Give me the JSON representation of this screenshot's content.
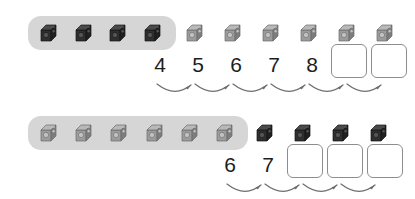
{
  "page": {
    "type": "counting-on-worksheet",
    "background_color": "#ffffff",
    "group_bar_color": "#d6d6d6",
    "dark_cube_color": "#3b3b3b",
    "light_cube_color": "#9a9a9a",
    "box_border_color": "#8d8d8d",
    "numeral_color": "#1d1d1d",
    "arrow_color": "#6e6e6e"
  },
  "rows": [
    {
      "id": "row-top",
      "group": {
        "label": "grouped-cubes",
        "count": 4,
        "shade": "dark",
        "x": 28,
        "y": 16,
        "width": 148,
        "height": 34
      },
      "loose_cubes": {
        "label": "loose-cubes",
        "count": 6,
        "shade": "light",
        "start_x": 186,
        "spacing": 38,
        "y": 16
      },
      "numerals": [
        {
          "value": "4",
          "x": 149,
          "y": 52
        },
        {
          "value": "5",
          "x": 187,
          "y": 52
        },
        {
          "value": "6",
          "x": 225,
          "y": 52
        },
        {
          "value": "7",
          "x": 263,
          "y": 52
        },
        {
          "value": "8",
          "x": 301,
          "y": 52
        }
      ],
      "answer_boxes": [
        {
          "label": "answer-box-1",
          "value": "",
          "x": 331,
          "y": 44,
          "width": 36,
          "height": 34
        },
        {
          "label": "answer-box-2",
          "value": "",
          "x": 371,
          "y": 44,
          "width": 36,
          "height": 34
        }
      ],
      "arrows": {
        "count": 6,
        "start_x": 157,
        "spacing": 38,
        "y": 80,
        "span": 36
      }
    },
    {
      "id": "row-bottom",
      "group": {
        "label": "grouped-cubes",
        "count": 6,
        "shade": "light",
        "x": 28,
        "y": 16,
        "width": 220,
        "height": 34
      },
      "loose_cubes": {
        "label": "loose-cubes",
        "count": 4,
        "shade": "dark",
        "start_x": 256,
        "spacing": 38,
        "y": 16
      },
      "numerals": [
        {
          "value": "6",
          "x": 219,
          "y": 52
        },
        {
          "value": "7",
          "x": 257,
          "y": 52
        }
      ],
      "answer_boxes": [
        {
          "label": "answer-box-1",
          "value": "",
          "x": 287,
          "y": 44,
          "width": 36,
          "height": 34
        },
        {
          "label": "answer-box-2",
          "value": "",
          "x": 327,
          "y": 44,
          "width": 36,
          "height": 34
        },
        {
          "label": "answer-box-3",
          "value": "",
          "x": 367,
          "y": 44,
          "width": 36,
          "height": 34
        }
      ],
      "arrows": {
        "count": 4,
        "start_x": 227,
        "spacing": 38,
        "y": 80,
        "span": 36
      }
    }
  ]
}
